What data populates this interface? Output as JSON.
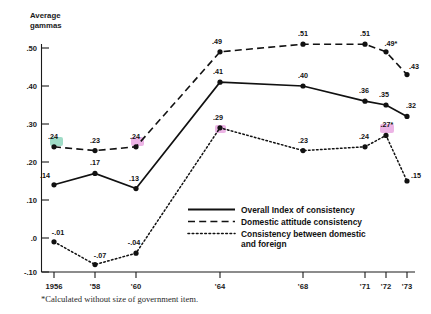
{
  "chart_data": {
    "type": "line",
    "title": "",
    "subtitle": "",
    "ylabel": "Average gammas",
    "xlabel": "",
    "categories": [
      "1956",
      "'58",
      "'60",
      "'64",
      "'68",
      "'71",
      "'72",
      "'73"
    ],
    "x": [
      1956,
      1958,
      1960,
      1964,
      1968,
      1971,
      1972,
      1973
    ],
    "ylim": [
      -0.1,
      0.5
    ],
    "ytick_labels": [
      ".50",
      ".40",
      ".30",
      ".20",
      ".10",
      ".0",
      "-.10"
    ],
    "ytick_values": [
      0.5,
      0.4,
      0.3,
      0.2,
      0.1,
      0.0,
      -0.1
    ],
    "grid": false,
    "legend_position": "inside-bottom-right",
    "series": [
      {
        "name": "Overall Index of consistency",
        "style": "solid",
        "values": [
          0.14,
          0.17,
          0.13,
          0.41,
          0.4,
          0.36,
          0.35,
          0.32
        ],
        "labels": [
          ".14",
          ".17",
          ".13",
          ".41",
          ".40",
          ".36",
          ".35",
          ".32"
        ]
      },
      {
        "name": "Domestic attitude consistency",
        "style": "dashed",
        "values": [
          0.24,
          0.23,
          0.24,
          0.49,
          0.51,
          0.51,
          0.49,
          0.43
        ],
        "labels": [
          ".24",
          ".23",
          ".24",
          ".49",
          ".51",
          ".51",
          ".49*",
          ".43"
        ]
      },
      {
        "name": "Consistency between domestic and foreign",
        "style": "dotted",
        "values": [
          -0.01,
          -0.07,
          -0.04,
          0.29,
          0.23,
          0.24,
          0.27,
          0.15
        ],
        "labels": [
          "-.01",
          "-.07",
          "-.04",
          ".29",
          ".23",
          ".24",
          ".27*",
          ".15"
        ]
      }
    ],
    "annotations": [
      {
        "text": "*Calculated without size of government item."
      }
    ],
    "highlight_colors": {
      "green": "#8fd6bd",
      "pink": "#e9a7e0"
    }
  },
  "legend": {
    "items": [
      {
        "label": "Overall Index of consistency",
        "style": "solid"
      },
      {
        "label": "Domestic attitude consistency",
        "style": "dashed"
      },
      {
        "label": "Consistency between domestic",
        "style": "dotted"
      },
      {
        "label": "and foreign",
        "style": "none"
      }
    ]
  },
  "footnote": {
    "text": "*Calculated without size of government item."
  },
  "axis": {
    "y_title_line1": "Average",
    "y_title_line2": "gammas",
    "y_ticks": [
      ".50",
      ".40",
      ".30",
      ".20",
      ".10",
      ".0",
      "-.10"
    ],
    "x_ticks": [
      "1956",
      "'58",
      "'60",
      "'64",
      "'68",
      "'71",
      "'72",
      "'73"
    ]
  },
  "point_labels": {
    "solid": [
      ".14",
      ".17",
      ".13",
      ".41",
      ".40",
      ".36",
      ".35",
      ".32"
    ],
    "dashed": [
      ".24",
      ".23",
      ".24",
      ".49",
      ".51",
      ".51",
      ".49*",
      ".43"
    ],
    "dotted": [
      "-.01",
      "-.07",
      "-.04",
      ".29",
      ".23",
      ".24",
      ".27*",
      ".15"
    ]
  }
}
